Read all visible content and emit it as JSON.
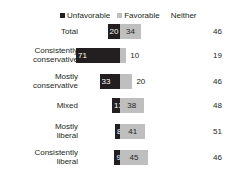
{
  "chart": {
    "title": "",
    "legend": {
      "unfavorable_label": "Unfavorable",
      "favorable_label": "Favorable",
      "neither_label": "Neither"
    },
    "colors": {
      "unfavorable": "#231f20",
      "favorable": "#bfbfbf",
      "text": "#231f20",
      "background": "#ffffff"
    }
  },
  "chart_data": {
    "type": "bar",
    "subtype": "diverging-stacked-bar",
    "title": "",
    "xlabel": "",
    "ylabel": "",
    "categories": [
      "Total",
      "Consistently conservative",
      "Mostly conservative",
      "Mixed",
      "Mostly liberal",
      "Consistently liberal"
    ],
    "series": [
      {
        "name": "Unfavorable",
        "values": [
          20,
          71,
          33,
          13,
          8,
          9
        ]
      },
      {
        "name": "Favorable",
        "values": [
          34,
          10,
          20,
          38,
          41,
          45
        ]
      },
      {
        "name": "Neither",
        "values": [
          46,
          19,
          46,
          48,
          51,
          46
        ]
      }
    ],
    "legend_position": "top",
    "grid": false,
    "units": "percent"
  },
  "rows": [
    {
      "label": "Total",
      "label_line1": "Total",
      "label_line2": "",
      "unfavorable": 20,
      "favorable": 34,
      "neither": 46
    },
    {
      "label": "Consistently conservative",
      "label_line1": "Consistently",
      "label_line2": "conservative",
      "unfavorable": 71,
      "favorable": 10,
      "neither": 19
    },
    {
      "label": "Mostly conservative",
      "label_line1": "Mostly",
      "label_line2": "conservative",
      "unfavorable": 33,
      "favorable": 20,
      "neither": 46
    },
    {
      "label": "Mixed",
      "label_line1": "Mixed",
      "label_line2": "",
      "unfavorable": 13,
      "favorable": 38,
      "neither": 48
    },
    {
      "label": "Mostly liberal",
      "label_line1": "Mostly",
      "label_line2": "liberal",
      "unfavorable": 8,
      "favorable": 41,
      "neither": 51
    },
    {
      "label": "Consistently liberal",
      "label_line1": "Consistently",
      "label_line2": "liberal",
      "unfavorable": 9,
      "favorable": 45,
      "neither": 46
    }
  ]
}
